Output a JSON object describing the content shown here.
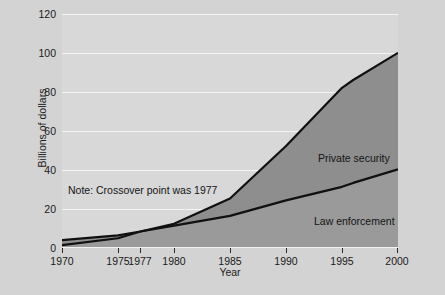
{
  "chart_data": {
    "type": "area",
    "title": "",
    "subtitle": "",
    "xlabel": "Year",
    "ylabel": "Billions of dollars",
    "xlim": [
      1970,
      2000
    ],
    "ylim": [
      0,
      120
    ],
    "ytick_labels": [
      "0",
      "20",
      "40",
      "60",
      "80",
      "100",
      "120"
    ],
    "ytick_values": [
      0,
      20,
      40,
      60,
      80,
      100,
      120
    ],
    "xtick_labels": [
      "1970",
      "1975",
      "1977",
      "1980",
      "1985",
      "1990",
      "1995",
      "2000"
    ],
    "xtick_values": [
      1970,
      1975,
      1977,
      1980,
      1985,
      1990,
      1995,
      2000
    ],
    "grid": "horizontal",
    "legend_position": "inline-labels",
    "x": [
      1970,
      1975,
      1977,
      1980,
      1985,
      1990,
      1995,
      1996,
      2000
    ],
    "series": [
      {
        "name": "Private security",
        "values": [
          3.5,
          6,
          8,
          12,
          25,
          52,
          82,
          86,
          100
        ],
        "fill_color": "#8e8e8e",
        "line_color": "#101010"
      },
      {
        "name": "Law enforcement",
        "values": [
          1,
          4.5,
          8,
          11,
          16,
          24,
          31,
          33,
          40
        ],
        "fill_color": "#9a9a9a",
        "line_color": "#101010"
      }
    ],
    "annotations": [
      {
        "text": "Note: Crossover point was 1977",
        "x": 1972.2,
        "y": 30
      },
      {
        "text": "Private security",
        "x": 1988.5,
        "y": 58
      },
      {
        "text": "Law enforcement",
        "x": 1988.2,
        "y": 25
      }
    ]
  },
  "colors": {
    "canvas_background": "#d3d3d3",
    "plot_background": "#d8d8d8",
    "gridline": "#f4f4f4",
    "text": "#1a1a1a",
    "private_security_fill": "#8e8e8e",
    "law_enforcement_fill": "#9a9a9a",
    "series_line": "#101010"
  }
}
